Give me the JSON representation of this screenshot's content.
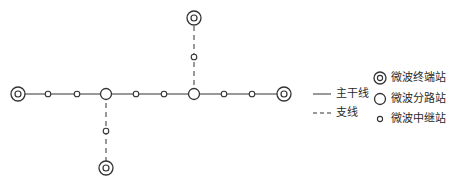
{
  "diagram": {
    "type": "microwave-relay-network",
    "colors": {
      "line": "#333333",
      "background": "#ffffff"
    },
    "main_line": {
      "y": 94,
      "x_start": 18,
      "x_end": 284
    },
    "nodes": [
      {
        "type": "terminal",
        "x": 18,
        "y": 94
      },
      {
        "type": "repeater",
        "x": 48,
        "y": 94
      },
      {
        "type": "repeater",
        "x": 77,
        "y": 94
      },
      {
        "type": "branch",
        "x": 106,
        "y": 94
      },
      {
        "type": "repeater",
        "x": 136,
        "y": 94
      },
      {
        "type": "repeater",
        "x": 164,
        "y": 94
      },
      {
        "type": "branch",
        "x": 194,
        "y": 94
      },
      {
        "type": "repeater",
        "x": 224,
        "y": 94
      },
      {
        "type": "repeater",
        "x": 252,
        "y": 94
      },
      {
        "type": "terminal",
        "x": 284,
        "y": 94
      },
      {
        "type": "repeater",
        "x": 194,
        "y": 57
      },
      {
        "type": "terminal",
        "x": 194,
        "y": 18
      },
      {
        "type": "repeater",
        "x": 106,
        "y": 131
      },
      {
        "type": "terminal",
        "x": 106,
        "y": 168
      }
    ],
    "branches": [
      {
        "from": [
          194,
          94
        ],
        "to": [
          194,
          18
        ]
      },
      {
        "from": [
          106,
          94
        ],
        "to": [
          106,
          168
        ]
      }
    ]
  },
  "legend": {
    "lines": [
      {
        "style": "solid",
        "label": "主干线"
      },
      {
        "style": "dashed",
        "label": "支线"
      }
    ],
    "stations": [
      {
        "symbol": "terminal",
        "label": "微波终端站"
      },
      {
        "symbol": "branch",
        "label": "微波分路站"
      },
      {
        "symbol": "repeater",
        "label": "微波中继站"
      }
    ]
  }
}
